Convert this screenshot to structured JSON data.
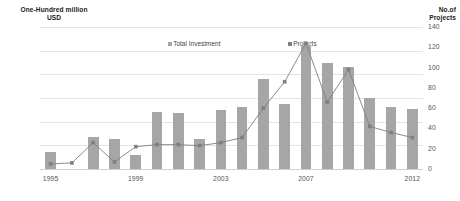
{
  "chart_data": {
    "type": "bar",
    "title": "",
    "xlabel": "",
    "ylabel": "One-Hundred million USD",
    "y2label": "No.of Projects",
    "ylim": [
      0,
      120
    ],
    "y2lim": [
      0,
      140
    ],
    "grid": true,
    "legend_position": "top-center",
    "categories": [
      "1995",
      "1996",
      "1997",
      "1998",
      "1999",
      "2000",
      "2001",
      "2002",
      "2003",
      "2004",
      "2005",
      "2006",
      "2007",
      "2008",
      "2009",
      "2010",
      "2011",
      "2012"
    ],
    "x_tick_labels": [
      "1995",
      "1999",
      "2003",
      "2007",
      "2012"
    ],
    "y_tick_labels": [
      "0.0",
      "20.0",
      "40.0",
      "60.0",
      "80.0",
      "100.0",
      "120.0"
    ],
    "y_tick_values": [
      0,
      20,
      40,
      60,
      80,
      100,
      120
    ],
    "y2_tick_labels": [
      "0",
      "20",
      "40",
      "60",
      "80",
      "100",
      "120",
      "140"
    ],
    "y2_tick_values": [
      0,
      20,
      40,
      60,
      80,
      100,
      120,
      140
    ],
    "series": [
      {
        "name": "Total Investment",
        "type": "bar",
        "axis": "left",
        "color": "#a6a6a6",
        "values": [
          14,
          0,
          27,
          25,
          12,
          48,
          47,
          25,
          50,
          52,
          76,
          55,
          105,
          90,
          86,
          60,
          52,
          51
        ]
      },
      {
        "name": "Projects",
        "type": "line",
        "axis": "right",
        "color": "#7f7f7f",
        "values": [
          5,
          6,
          26,
          7,
          22,
          24,
          24,
          23,
          26,
          31,
          60,
          86,
          124,
          66,
          98,
          42,
          36,
          31
        ]
      }
    ]
  },
  "axis_titles": {
    "left": "One-Hundred million\nUSD",
    "right": "No.of\nProjects"
  },
  "legend": {
    "investment_label": "Total Investment",
    "projects_label": "Projects"
  },
  "colors": {
    "bar": "#a6a6a6",
    "line": "#7f7f7f",
    "grid": "#e4e4e4",
    "text": "#555555"
  }
}
